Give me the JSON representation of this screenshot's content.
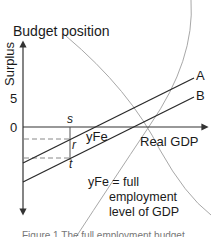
{
  "diagram": {
    "title": "Budget position",
    "y_axis": {
      "label": "Surplus",
      "ticks": [
        {
          "label": "5"
        },
        {
          "label": "0"
        }
      ]
    },
    "x_axis": {
      "label": "Real GDP"
    },
    "lines": [
      {
        "name": "A",
        "label": "A"
      },
      {
        "name": "B",
        "label": "B"
      }
    ],
    "points": {
      "s": "s",
      "r": "r",
      "t": "t",
      "yfe": "yFe"
    },
    "legend": {
      "line1": "yFe = full",
      "line2": "employment",
      "line3": "level of GDP"
    },
    "caption": "Figure 1 The full employment budget"
  },
  "colors": {
    "axis": "#333333",
    "lines": "#2a2a2a",
    "dashed": "#888888",
    "overlay_curves": "#a8a8a8"
  }
}
